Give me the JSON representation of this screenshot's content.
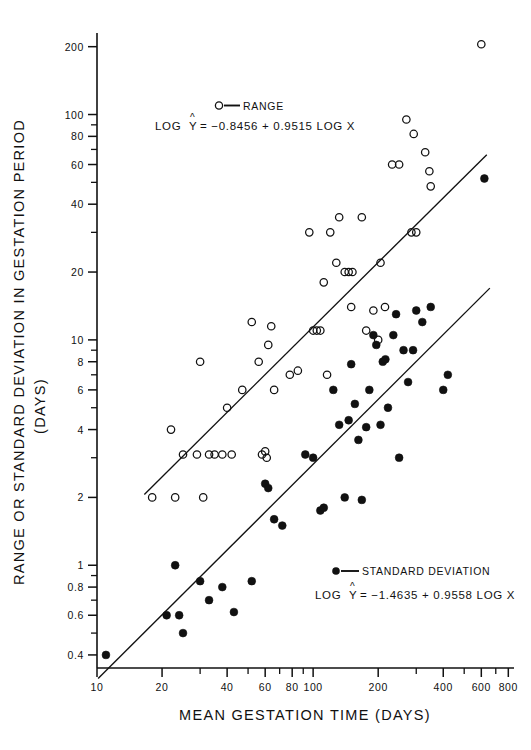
{
  "figure": {
    "background": "#ffffff",
    "ink": "#111111"
  },
  "axes": {
    "x_title": "MEAN  GESTATION  TIME   (DAYS)",
    "y_title_line1": "RANGE OR STANDARD DEVIATION IN GESTATION PERIOD",
    "y_title_line2": "(DAYS)",
    "x_labeled_ticks": [
      10,
      20,
      40,
      60,
      80,
      100,
      200,
      400,
      600,
      800
    ],
    "x_minor_ticks": [
      30,
      50,
      70,
      90,
      300,
      500,
      700
    ],
    "y_labeled_ticks": [
      0.4,
      0.6,
      0.8,
      1,
      2,
      4,
      6,
      8,
      10,
      20,
      40,
      60,
      80,
      100,
      200
    ],
    "y_minor_ticks": [
      0.5,
      0.7,
      0.9,
      3,
      5,
      7,
      9,
      30,
      50,
      70,
      90
    ],
    "xlim": [
      10,
      850
    ],
    "ylim": [
      0.35,
      230
    ],
    "scale": "log-log",
    "grid": false
  },
  "legend": {
    "range": {
      "marker": "open-circle",
      "label": "RANGE",
      "eq_prefix": "LOG",
      "eq_var": "Y",
      "eq_body": "= −0.8456 + 0.9515  LOG X"
    },
    "sd": {
      "marker": "filled-circle",
      "label": "STANDARD  DEVIATION",
      "eq_prefix": "LOG",
      "eq_var": "Y",
      "eq_body": "= −1.4635 + 0.9558  LOG X"
    }
  },
  "chart_data": {
    "type": "scatter",
    "title": "",
    "xlabel": "MEAN  GESTATION  TIME   (DAYS)",
    "ylabel": "RANGE OR STANDARD DEVIATION IN GESTATION PERIOD (DAYS)",
    "xscale": "log",
    "yscale": "log",
    "xlim": [
      10,
      850
    ],
    "ylim": [
      0.35,
      230
    ],
    "grid": false,
    "legend_position": "inside-top-center and inside-bottom-right",
    "series": [
      {
        "name": "RANGE",
        "marker": "open-circle",
        "fit_label": "LOG Ŷ = −0.8456 + 0.9515 LOG X",
        "fit_intercept": -0.8456,
        "fit_slope": 0.9515,
        "points": [
          [
            18,
            2.0
          ],
          [
            22,
            4.0
          ],
          [
            23,
            2.0
          ],
          [
            25,
            3.1
          ],
          [
            29,
            3.1
          ],
          [
            30,
            8.0
          ],
          [
            31,
            2.0
          ],
          [
            33,
            3.1
          ],
          [
            35,
            3.1
          ],
          [
            38,
            3.1
          ],
          [
            40,
            5.0
          ],
          [
            42,
            3.1
          ],
          [
            47,
            6.0
          ],
          [
            52,
            12.0
          ],
          [
            56,
            8.0
          ],
          [
            58,
            3.1
          ],
          [
            60,
            3.2
          ],
          [
            61,
            3.0
          ],
          [
            62,
            9.5
          ],
          [
            64,
            11.5
          ],
          [
            66,
            6.0
          ],
          [
            78,
            7.0
          ],
          [
            85,
            7.3
          ],
          [
            96,
            30.0
          ],
          [
            100,
            11.0
          ],
          [
            104,
            11.0
          ],
          [
            108,
            11.0
          ],
          [
            112,
            18.0
          ],
          [
            116,
            7.0
          ],
          [
            120,
            30.0
          ],
          [
            128,
            22.0
          ],
          [
            132,
            35.0
          ],
          [
            140,
            20.0
          ],
          [
            146,
            20.0
          ],
          [
            150,
            14.0
          ],
          [
            152,
            20.0
          ],
          [
            168,
            35.0
          ],
          [
            176,
            11.0
          ],
          [
            190,
            13.5
          ],
          [
            200,
            10.0
          ],
          [
            205,
            22.0
          ],
          [
            215,
            14.0
          ],
          [
            232,
            60.0
          ],
          [
            250,
            60.0
          ],
          [
            270,
            95.0
          ],
          [
            285,
            30.0
          ],
          [
            292,
            82.0
          ],
          [
            300,
            30.0
          ],
          [
            330,
            68.0
          ],
          [
            345,
            56.0
          ],
          [
            350,
            48.0
          ],
          [
            600,
            205.0
          ]
        ]
      },
      {
        "name": "STANDARD DEVIATION",
        "marker": "filled-circle",
        "fit_label": "LOG Ŷ = −1.4635 + 0.9558 LOG X",
        "fit_intercept": -1.4635,
        "fit_slope": 0.9558,
        "points": [
          [
            11,
            0.4
          ],
          [
            21,
            0.6
          ],
          [
            23,
            1.0
          ],
          [
            24,
            0.6
          ],
          [
            25,
            0.5
          ],
          [
            30,
            0.85
          ],
          [
            33,
            0.7
          ],
          [
            38,
            0.8
          ],
          [
            43,
            0.62
          ],
          [
            52,
            0.85
          ],
          [
            60,
            2.3
          ],
          [
            62,
            2.2
          ],
          [
            66,
            1.6
          ],
          [
            72,
            1.5
          ],
          [
            92,
            3.1
          ],
          [
            100,
            3.0
          ],
          [
            108,
            1.75
          ],
          [
            112,
            1.8
          ],
          [
            124,
            6.0
          ],
          [
            132,
            4.2
          ],
          [
            140,
            2.0
          ],
          [
            146,
            4.4
          ],
          [
            150,
            7.8
          ],
          [
            156,
            5.2
          ],
          [
            162,
            3.6
          ],
          [
            168,
            1.95
          ],
          [
            176,
            4.1
          ],
          [
            182,
            6.0
          ],
          [
            190,
            10.5
          ],
          [
            196,
            9.5
          ],
          [
            205,
            4.2
          ],
          [
            210,
            8.0
          ],
          [
            216,
            8.2
          ],
          [
            222,
            5.0
          ],
          [
            235,
            10.5
          ],
          [
            242,
            13.0
          ],
          [
            250,
            3.0
          ],
          [
            262,
            9.0
          ],
          [
            275,
            6.5
          ],
          [
            290,
            9.0
          ],
          [
            300,
            13.5
          ],
          [
            320,
            12.0
          ],
          [
            350,
            14.0
          ],
          [
            400,
            6.0
          ],
          [
            420,
            7.0
          ],
          [
            620,
            52.0
          ]
        ]
      }
    ]
  }
}
